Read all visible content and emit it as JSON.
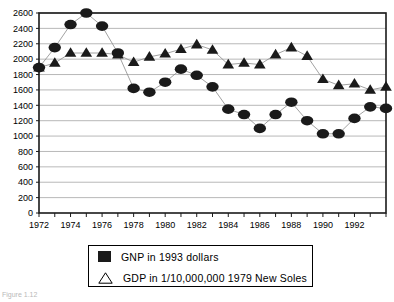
{
  "chart_data": {
    "type": "line",
    "title": "",
    "xlabel": "",
    "ylabel": "",
    "xlim": [
      1972,
      1994
    ],
    "ylim": [
      0,
      2600
    ],
    "ytick_step": 200,
    "xtick_step": 1,
    "xtick_label_step": 4,
    "grid": true,
    "legend_position": "below-plot",
    "y_ticks": [
      2600,
      2400,
      2200,
      2000,
      1800,
      1600,
      1400,
      1200,
      1000,
      800,
      600,
      400,
      200,
      0
    ],
    "x_ticks": [
      1972,
      1973,
      1974,
      1975,
      1976,
      1977,
      1978,
      1979,
      1980,
      1981,
      1982,
      1983,
      1984,
      1985,
      1986,
      1987,
      1988,
      1989,
      1990,
      1991,
      1992,
      1993,
      1994
    ],
    "x_tick_labels": [
      "1972",
      "",
      "1974",
      "",
      "1976",
      "",
      "1978",
      "",
      "1980",
      "",
      "1982",
      "",
      "1984",
      "",
      "1986",
      "",
      "1988",
      "",
      "1990",
      "",
      "1992",
      "",
      ""
    ],
    "x": [
      1972,
      1973,
      1974,
      1975,
      1976,
      1977,
      1978,
      1979,
      1980,
      1981,
      1982,
      1983,
      1984,
      1985,
      1986,
      1987,
      1988,
      1989,
      1990,
      1991,
      1992,
      1993,
      1994
    ],
    "series": [
      {
        "name": "GNP in 1993 dollars",
        "marker": "filled-circle",
        "color": "#1a1a1a",
        "values": [
          1890,
          2150,
          2450,
          2600,
          2430,
          2080,
          1620,
          1570,
          1700,
          1870,
          1790,
          1640,
          1350,
          1280,
          1100,
          1280,
          1440,
          1200,
          1030,
          1030,
          1230,
          1380,
          1360
        ]
      },
      {
        "name": "GDP in 1/10,000,000  1979 New Soles",
        "marker": "filled-triangle",
        "color": "#1a1a1a",
        "values": [
          1890,
          1950,
          2080,
          2080,
          2080,
          2060,
          1960,
          2030,
          2070,
          2130,
          2190,
          2120,
          1930,
          1950,
          1930,
          2060,
          2150,
          2040,
          1740,
          1660,
          1680,
          1600,
          1640
        ]
      }
    ]
  },
  "legend": {
    "items": [
      {
        "label": "GNP in 1993 dollars",
        "marker": "filled-square"
      },
      {
        "label": "GDP in 1/10,000,000  1979 New Soles",
        "marker": "outline-triangle"
      }
    ]
  },
  "caption": {
    "text": "Figure 1.12"
  }
}
